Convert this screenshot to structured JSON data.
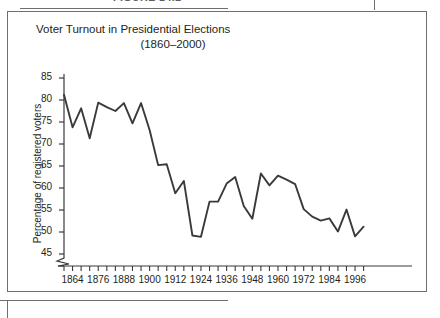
{
  "figure": {
    "caption": "FIGURE 14.2",
    "box_border_color": "#6f6f6f"
  },
  "chart_data": {
    "type": "line",
    "title": "Voter Turnout in Presidential Elections",
    "subtitle": "(1860–2000)",
    "xlabel": "",
    "ylabel": "Percentage of registered voters",
    "ylim": [
      45,
      85
    ],
    "yticks": [
      45,
      50,
      55,
      60,
      65,
      70,
      75,
      80,
      85
    ],
    "ytick_labels": [
      "45",
      "50",
      "55",
      "60",
      "65",
      "70",
      "75",
      "80",
      "85"
    ],
    "y_axis_break": true,
    "xlim": [
      1860,
      2000
    ],
    "xtick_interval": 4,
    "xtick_label_interval": 12,
    "xtick_labels": [
      "1864",
      "1876",
      "1888",
      "1900",
      "1912",
      "1924",
      "1936",
      "1948",
      "1960",
      "1972",
      "1984",
      "1996"
    ],
    "grid": false,
    "legend": null,
    "line_color": "#3a3a3a",
    "x": [
      1860,
      1864,
      1868,
      1872,
      1876,
      1880,
      1884,
      1888,
      1892,
      1896,
      1900,
      1904,
      1908,
      1912,
      1916,
      1920,
      1924,
      1928,
      1932,
      1936,
      1940,
      1944,
      1948,
      1952,
      1956,
      1960,
      1964,
      1968,
      1972,
      1976,
      1980,
      1984,
      1988,
      1992,
      1996,
      2000
    ],
    "values": [
      81.2,
      73.8,
      78.1,
      71.3,
      79.4,
      78.4,
      77.5,
      79.3,
      74.7,
      79.3,
      73.2,
      65.2,
      65.4,
      58.8,
      61.6,
      49.2,
      48.9,
      56.9,
      56.9,
      61.0,
      62.5,
      55.9,
      53.0,
      63.3,
      60.6,
      62.8,
      61.9,
      60.9,
      55.2,
      53.5,
      52.6,
      53.1,
      50.1,
      55.1,
      49.0,
      51.2
    ],
    "annotations": []
  }
}
